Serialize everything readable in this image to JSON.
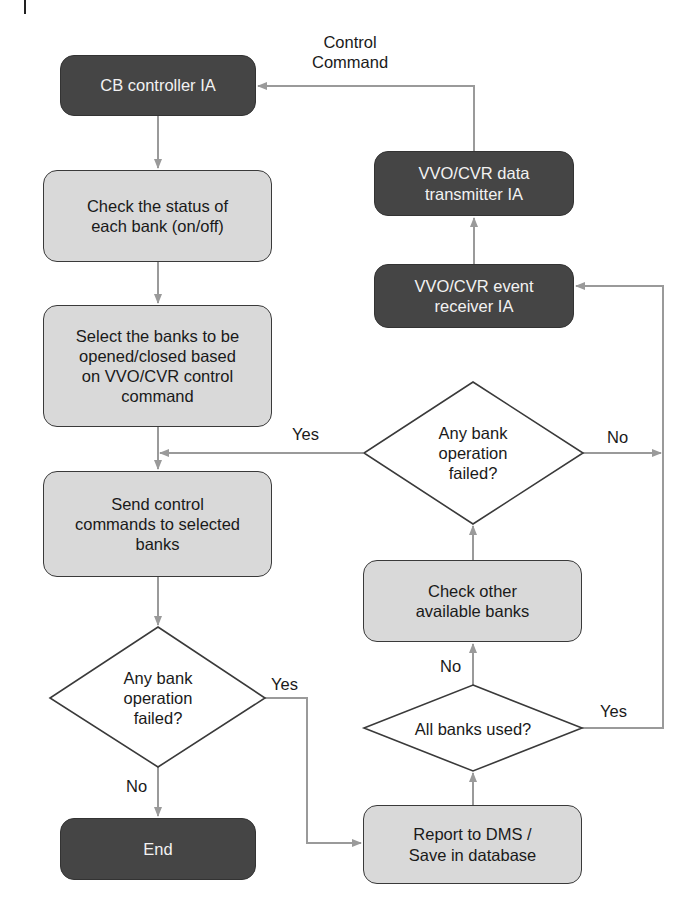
{
  "diagram": {
    "type": "flowchart",
    "colors": {
      "dark_node": "#454545",
      "light_node": "#d9d9d9",
      "connector": "#9a9a9a",
      "decision_border": "#3a3a3a"
    },
    "nodes": {
      "cb_controller": "CB controller IA",
      "check_status": "Check the status of\neach bank (on/off)",
      "select_banks": "Select the banks to be\nopened/closed based\non VVO/CVR control\ncommand",
      "send_commands": "Send control\ncommands to selected\nbanks",
      "decision_left": "Any bank\noperation\nfailed?",
      "end": "End",
      "data_transmitter": "VVO/CVR data\ntransmitter IA",
      "event_receiver": "VVO/CVR event\nreceiver IA",
      "decision_right": "Any bank\noperation\nfailed?",
      "check_other": "Check other\navailable banks",
      "all_banks_used": "All banks used?",
      "report": "Report to DMS /\nSave in database"
    },
    "edge_labels": {
      "control_command": "Control\nCommand",
      "right_decision_yes": "Yes",
      "right_decision_no": "No",
      "left_decision_yes": "Yes",
      "left_decision_no": "No",
      "all_used_no": "No",
      "all_used_yes": "Yes"
    }
  }
}
